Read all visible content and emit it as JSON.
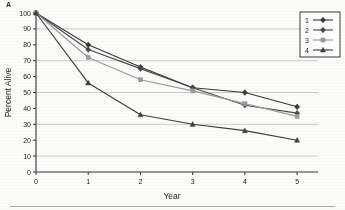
{
  "panel": {
    "label": "A"
  },
  "chart_data": {
    "type": "line",
    "title": "",
    "xlabel": "Year",
    "ylabel": "Percent Alive",
    "x": [
      0,
      1,
      2,
      3,
      4,
      5
    ],
    "xlim": [
      0,
      5.4
    ],
    "ylim": [
      0,
      100
    ],
    "xticks": [
      "0",
      "1",
      "2",
      "3",
      "4",
      "5"
    ],
    "yticks": [
      "0",
      "10",
      "20",
      "30",
      "40",
      "50",
      "60",
      "70",
      "80",
      "90",
      "100"
    ],
    "grid": "horizontal gridlines at 10, 30, 50, 70, 90",
    "gridlines": [
      10,
      30,
      50,
      70,
      90
    ],
    "legend_position": "top-right",
    "series": [
      {
        "name": "1",
        "label": "1",
        "marker": "diamond",
        "color": "#3a3a3a",
        "values": [
          100,
          80,
          66,
          53,
          50,
          41
        ]
      },
      {
        "name": "2",
        "label": "2",
        "marker": "diamond",
        "color": "#4a4a4a",
        "values": [
          100,
          77,
          65,
          53,
          42,
          37
        ]
      },
      {
        "name": "3",
        "label": "3",
        "marker": "square",
        "color": "#9a9a9a",
        "values": [
          100,
          72,
          58,
          51,
          43,
          35
        ]
      },
      {
        "name": "4",
        "label": "4",
        "marker": "triangle",
        "color": "#3d3d3d",
        "values": [
          100,
          56,
          36,
          30,
          26,
          20
        ]
      }
    ]
  }
}
